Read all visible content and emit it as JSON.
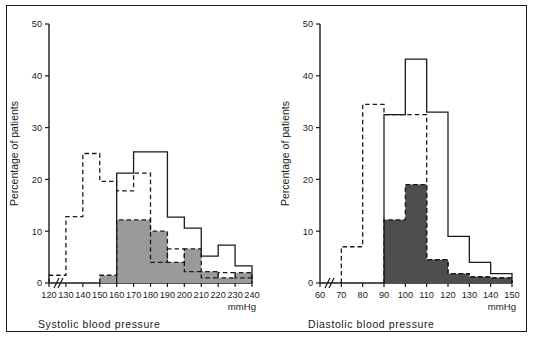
{
  "figure": {
    "background": "#ffffff",
    "border_color": "#1a1a1a",
    "ink_color": "#1a1a1a"
  },
  "chart_data": [
    {
      "id": "systolic",
      "type": "bar",
      "title": "",
      "xlabel": "Systolic  blood  pressure",
      "ylabel": "Percentage of patients",
      "units": "mmHg",
      "axis_break": true,
      "grid": false,
      "legend_position": "none",
      "ylim": [
        0,
        50
      ],
      "yticks": [
        0,
        10,
        20,
        30,
        40,
        50
      ],
      "xlim": [
        120,
        240
      ],
      "xticks": [
        120,
        130,
        140,
        150,
        160,
        170,
        180,
        190,
        200,
        210,
        220,
        230,
        240
      ],
      "bin_edges": [
        120,
        130,
        140,
        150,
        160,
        170,
        180,
        190,
        200,
        210,
        220,
        230,
        240
      ],
      "series": [
        {
          "name": "dashed-outline-histogram",
          "style": "dashed",
          "fill": "none",
          "color": "#1a1a1a",
          "values": [
            1.5,
            12.8,
            25.0,
            19.6,
            17.8,
            21.2,
            4.0,
            6.6,
            2.2,
            1.0,
            2.0,
            1.0
          ]
        },
        {
          "name": "solid-outline-histogram",
          "style": "solid",
          "fill": "none",
          "color": "#1a1a1a",
          "values": [
            0,
            0,
            0,
            0,
            21.2,
            25.3,
            25.3,
            12.7,
            10.6,
            5.2,
            7.3,
            3.3
          ]
        },
        {
          "name": "shaded-histogram",
          "style": "dashed-top",
          "fill": "#9a9a9a",
          "color": "#1a1a1a",
          "values": [
            0,
            0,
            0,
            1.5,
            12.2,
            12.2,
            10.0,
            4.0,
            6.6,
            2.2,
            1.0,
            2.0
          ]
        }
      ]
    },
    {
      "id": "diastolic",
      "type": "bar",
      "title": "",
      "xlabel": "Diastolic  blood  pressure",
      "ylabel": "Percentage of patients",
      "units": "mmHg",
      "axis_break": true,
      "grid": false,
      "legend_position": "none",
      "ylim": [
        0,
        50
      ],
      "yticks": [
        0,
        10,
        20,
        30,
        40,
        50
      ],
      "xlim": [
        60,
        150
      ],
      "xticks": [
        60,
        70,
        80,
        90,
        100,
        110,
        120,
        130,
        140,
        150
      ],
      "bin_edges": [
        60,
        70,
        80,
        90,
        100,
        110,
        120,
        130,
        140,
        150
      ],
      "series": [
        {
          "name": "dashed-outline-histogram",
          "style": "dashed",
          "fill": "none",
          "color": "#1a1a1a",
          "values": [
            0,
            7.0,
            34.5,
            32.5,
            32.5,
            4.5,
            1.8,
            1.2,
            1.0
          ]
        },
        {
          "name": "solid-outline-histogram",
          "style": "solid",
          "fill": "none",
          "color": "#1a1a1a",
          "values": [
            0,
            0,
            0,
            32.5,
            43.2,
            33.0,
            9.0,
            4.0,
            1.8
          ]
        },
        {
          "name": "shaded-histogram",
          "style": "dashed-top",
          "fill": "#4e4e4e",
          "color": "#1a1a1a",
          "values": [
            0,
            0,
            0,
            12.2,
            19.0,
            4.5,
            1.8,
            1.2,
            1.0
          ]
        }
      ]
    }
  ],
  "panels": {
    "systolic": {
      "ylabel": "Percentage of patients",
      "xtitle": "Systolic  blood  pressure",
      "units": "mmHg",
      "yticks": [
        "0",
        "10",
        "20",
        "30",
        "40",
        "50"
      ],
      "xticks": [
        "120",
        "130",
        "140",
        "150",
        "160",
        "170",
        "180",
        "190",
        "200",
        "210",
        "220",
        "230",
        "240"
      ]
    },
    "diastolic": {
      "ylabel": "Percentage of patients",
      "xtitle": "Diastolic  blood  pressure",
      "units": "mmHg",
      "yticks": [
        "0",
        "10",
        "20",
        "30",
        "40",
        "50"
      ],
      "xticks": [
        "60",
        "70",
        "80",
        "90",
        "100",
        "110",
        "120",
        "130",
        "140",
        "150"
      ]
    }
  }
}
